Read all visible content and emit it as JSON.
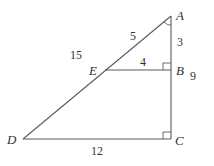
{
  "diagram": {
    "type": "similar-triangles",
    "vertices": {
      "A": {
        "label": "A",
        "x": 171,
        "y": 16
      },
      "B": {
        "label": "B",
        "x": 171,
        "y": 70
      },
      "C": {
        "label": "C",
        "x": 171,
        "y": 139
      },
      "D": {
        "label": "D",
        "x": 23,
        "y": 139
      },
      "E": {
        "label": "E",
        "x": 105,
        "y": 70
      }
    },
    "segments": [
      {
        "from": "A",
        "to": "D"
      },
      {
        "from": "A",
        "to": "C"
      },
      {
        "from": "D",
        "to": "C"
      },
      {
        "from": "E",
        "to": "B"
      }
    ],
    "lengths": {
      "AE": "5",
      "AB": "3",
      "AD": "15",
      "EB": "4",
      "AC": "9",
      "DC": "12"
    },
    "right_angles": [
      "B",
      "C"
    ],
    "angle_marks": [
      "A"
    ],
    "colors": {
      "line": "#5a5a5a",
      "text": "#333333",
      "background": "#ffffff"
    }
  }
}
